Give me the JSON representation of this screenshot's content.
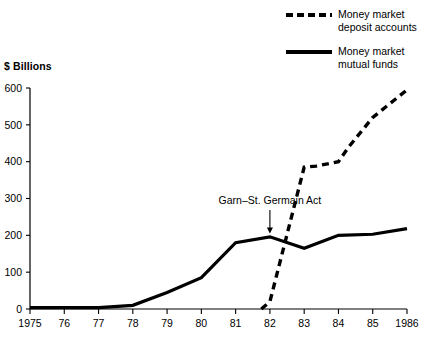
{
  "chart_data": {
    "type": "line",
    "title": "",
    "subtitle": "",
    "xlabel": "",
    "ylabel": "$ Billions",
    "ylim": [
      0,
      600
    ],
    "xlim": [
      1975,
      1986
    ],
    "yticks": [
      0,
      100,
      200,
      300,
      400,
      500,
      600
    ],
    "ytick_labels": [
      "0",
      "100",
      "200",
      "300",
      "400",
      "500",
      "600"
    ],
    "xticks": [
      1975,
      1976,
      1977,
      1978,
      1979,
      1980,
      1981,
      1982,
      1983,
      1984,
      1985,
      1986
    ],
    "xtick_labels": [
      "1975",
      "76",
      "77",
      "78",
      "79",
      "80",
      "81",
      "82",
      "83",
      "84",
      "85",
      "1986"
    ],
    "grid": false,
    "legend_position": "top-right",
    "series": [
      {
        "name": "Money market deposit accounts",
        "style": "dashed",
        "color": "#000000",
        "x": [
          1981.75,
          1982.0,
          1983.0,
          1983.35,
          1984.0,
          1984.3,
          1985.0,
          1986.0
        ],
        "values": [
          0,
          20,
          385,
          388,
          400,
          440,
          520,
          595
        ]
      },
      {
        "name": "Money market mutual funds",
        "style": "solid",
        "color": "#000000",
        "x": [
          1975,
          1976,
          1977,
          1978,
          1979,
          1980,
          1981,
          1982,
          1983,
          1984,
          1985,
          1986
        ],
        "values": [
          4,
          4,
          4,
          10,
          45,
          85,
          180,
          196,
          165,
          200,
          203,
          218
        ]
      }
    ],
    "annotations": [
      {
        "text": "Garn–St. Germain Act",
        "x": 1982.0,
        "y": 285,
        "points_to_x": 1982.0,
        "points_to_y": 205
      }
    ]
  },
  "legend": {
    "items": [
      {
        "label": "Money market\ndeposit accounts",
        "style": "dashed",
        "color": "#000000"
      },
      {
        "label": "Money market\nmutual funds",
        "style": "solid",
        "color": "#000000"
      }
    ]
  },
  "axis_title": "$ Billions"
}
